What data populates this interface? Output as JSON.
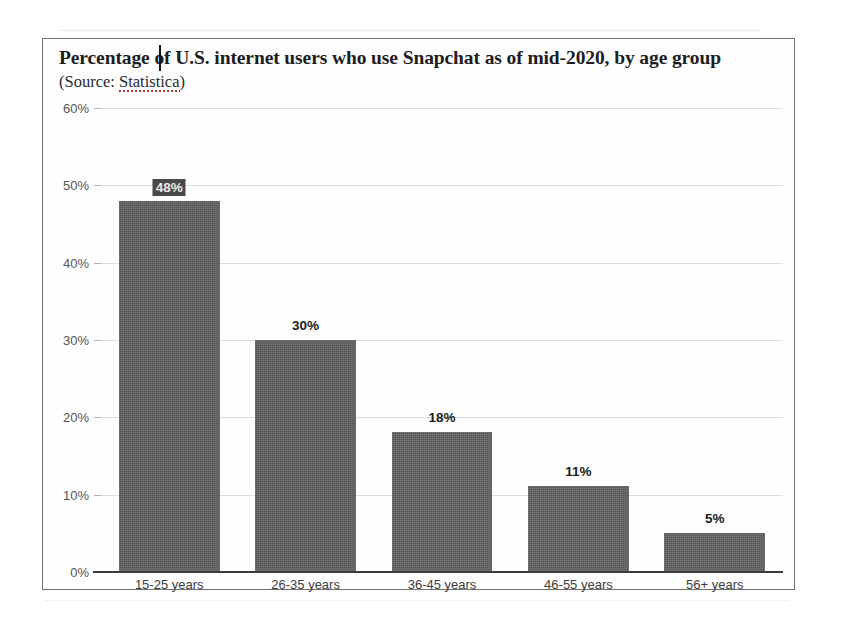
{
  "document": {
    "background_color": "#ffffff",
    "frame_border_color": "#6f6f6f"
  },
  "chart_data": {
    "type": "bar",
    "title": "Percentage of U.S. internet users who use Snapchat as of mid-2020, by age group",
    "subtitle": "(Source: Statistica)",
    "source_prefix": "(Source: ",
    "source_name": "Statistica",
    "source_suffix": ")",
    "categories": [
      "15-25 years",
      "26-35 years",
      "36-45 years",
      "46-55 years",
      "56+ years"
    ],
    "values": [
      48,
      30,
      18,
      11,
      5
    ],
    "value_labels": [
      "48%",
      "30%",
      "18%",
      "11%",
      "5%"
    ],
    "xlabel": "",
    "ylabel": "",
    "ylim": [
      0,
      60
    ],
    "ytick_values": [
      0,
      10,
      20,
      30,
      40,
      50,
      60
    ],
    "ytick_labels": [
      "0%",
      "10%",
      "20%",
      "30%",
      "40%",
      "50%",
      "60%"
    ],
    "grid": true,
    "legend": false,
    "bar_color": "#616161",
    "gridline_color": "#dcdcdc",
    "axis_color": "#3b3b3b",
    "selected_label_index": 0
  }
}
